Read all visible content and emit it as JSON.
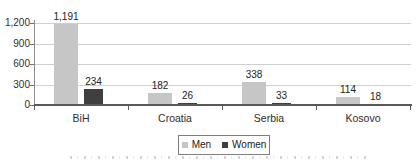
{
  "chart_data": {
    "type": "bar",
    "title": "",
    "xlabel": "",
    "ylabel": "",
    "categories": [
      "BiH",
      "Croatia",
      "Serbia",
      "Kosovo"
    ],
    "series": [
      {
        "name": "Men",
        "color": "#c6c6c6",
        "values": [
          1191,
          182,
          338,
          114
        ],
        "labels": [
          "1,191",
          "182",
          "338",
          "114"
        ]
      },
      {
        "name": "Women",
        "color": "#3f3f3f",
        "values": [
          234,
          26,
          33,
          18
        ],
        "labels": [
          "234",
          "26",
          "33",
          "18"
        ]
      }
    ],
    "y_axis": {
      "min": 0,
      "max": 1200,
      "step": 300,
      "tick_labels": [
        "1,200",
        "900",
        "600",
        "300",
        "0"
      ]
    },
    "grid": "horizontal",
    "legend": {
      "position": "bottom-center",
      "items": [
        "Men",
        "Women"
      ]
    }
  },
  "colors": {
    "grid": "#cfcfcf",
    "axis": "#8a8a8a",
    "baseline": "#5a5a5a",
    "text": "#2e2e2e",
    "men_bar": "#c6c6c6",
    "women_bar": "#3f3f3f"
  }
}
